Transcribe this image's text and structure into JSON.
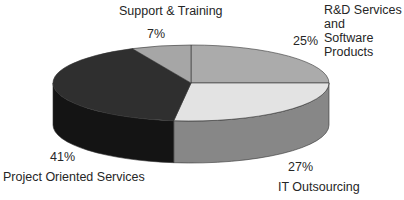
{
  "chart_data": {
    "type": "pie",
    "style": "3d",
    "title": "",
    "categories": [
      "R&D Services and Software Products",
      "IT Outsourcing",
      "Project Oriented Services",
      "Support & Training"
    ],
    "values": [
      25,
      27,
      41,
      7
    ],
    "value_labels": [
      "25%",
      "27%",
      "41%",
      "7%"
    ],
    "colors_top": [
      "#ababab",
      "#e3e3e3",
      "#2f2f2f",
      "#a6a6a6"
    ],
    "colors_side": [
      "#8c8c8c",
      "#878787",
      "#141414",
      "#8a8a8a"
    ],
    "legend": "none (data labels outside slices)"
  },
  "labels": {
    "support": {
      "name": "Support & Training",
      "pct": "7%"
    },
    "rnd": {
      "name_line1": "R&D Services",
      "name_line2": "and",
      "name_line3": "Software",
      "name_line4": "Products",
      "pct": "25%"
    },
    "it": {
      "name": "IT Outsourcing",
      "pct": "27%"
    },
    "project": {
      "name": "Project Oriented Services",
      "pct": "41%"
    }
  }
}
